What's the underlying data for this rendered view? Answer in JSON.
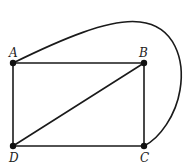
{
  "diagram": {
    "type": "graph",
    "vertices": [
      {
        "id": "A",
        "label": "A",
        "x": 13,
        "y": 63
      },
      {
        "id": "B",
        "label": "B",
        "x": 144,
        "y": 63
      },
      {
        "id": "C",
        "label": "C",
        "x": 144,
        "y": 146
      },
      {
        "id": "D",
        "label": "D",
        "x": 13,
        "y": 146
      }
    ],
    "edges": [
      {
        "from": "A",
        "to": "B",
        "style": "straight"
      },
      {
        "from": "B",
        "to": "C",
        "style": "straight"
      },
      {
        "from": "C",
        "to": "D",
        "style": "straight"
      },
      {
        "from": "D",
        "to": "A",
        "style": "straight"
      },
      {
        "from": "D",
        "to": "B",
        "style": "straight"
      },
      {
        "from": "A",
        "to": "C",
        "style": "curved"
      }
    ],
    "colors": {
      "stroke": "#1a1a1a",
      "vertex": "#111111",
      "label": "#222222",
      "background": "#ffffff"
    }
  }
}
